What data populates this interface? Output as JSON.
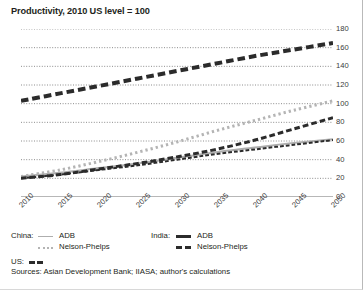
{
  "title": "Productivity, 2010 US level = 100",
  "sources": "Sources: Asian Development Bank; IIASA; author's calculations",
  "legend": {
    "china_group": "China:",
    "india_group": "India:",
    "us_group": "US:",
    "china_adb": "ADB",
    "china_np": "Nelson-Phelps",
    "india_adb": "ADB",
    "india_np": "Nelson-Phelps"
  },
  "colors": {
    "light_gray": "#aeaeae",
    "mid_gray": "#b4b4b4",
    "dark": "#2b2b2b",
    "gridline": "#6f6f6f",
    "axis": "#4a4a4a",
    "text": "#231f20"
  },
  "chart_data": {
    "type": "line",
    "title": "Productivity, 2010 US level = 100",
    "xlabel": "",
    "ylabel": "",
    "xlim": [
      2010,
      2050
    ],
    "ylim": [
      0,
      180
    ],
    "grid": true,
    "y_axis_position": "right",
    "legend_position": "below",
    "yticks": [
      0,
      20,
      40,
      60,
      80,
      100,
      120,
      140,
      160,
      180
    ],
    "xticks": [
      2010,
      2015,
      2020,
      2025,
      2030,
      2035,
      2040,
      2045,
      2050
    ],
    "x_minor_tick_interval": 1,
    "x": [
      2010,
      2015,
      2020,
      2025,
      2030,
      2035,
      2040,
      2045,
      2050
    ],
    "series": [
      {
        "name": "China: ADB",
        "style": "solid",
        "color": "#aeaeae",
        "width": 2,
        "values": [
          22,
          26,
          31,
          36,
          42,
          48,
          53,
          58,
          62
        ]
      },
      {
        "name": "China: Nelson-Phelps",
        "style": "dotted",
        "color": "#b4b4b4",
        "width": 3,
        "values": [
          22,
          29,
          38,
          48,
          59,
          71,
          82,
          93,
          103
        ]
      },
      {
        "name": "India: ADB",
        "style": "dashed",
        "color": "#2b2b2b",
        "width": 3,
        "values": [
          20,
          24,
          30,
          36,
          43,
          51,
          61,
          73,
          85
        ]
      },
      {
        "name": "India: Nelson-Phelps",
        "style": "dashed",
        "color": "#2b2b2b",
        "width": 4,
        "values": [
          103,
          111,
          119,
          127,
          135,
          143,
          151,
          158,
          165
        ]
      },
      {
        "name": "US",
        "style": "dashed",
        "color": "#2b2b2b",
        "width": 2,
        "values": [
          20,
          24,
          29,
          34,
          40,
          46,
          51,
          56,
          61
        ]
      }
    ]
  }
}
